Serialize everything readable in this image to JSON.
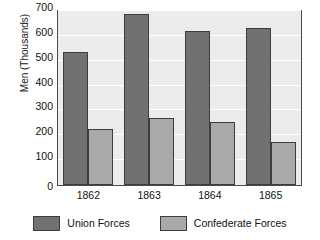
{
  "chart_data": {
    "type": "bar",
    "title": "",
    "xlabel": "",
    "ylabel": "Men (Thousands)",
    "categories": [
      "1862",
      "1863",
      "1864",
      "1865"
    ],
    "series": [
      {
        "name": "Union Forces",
        "color": "#717171",
        "values": [
          535,
          690,
          620,
          630
        ]
      },
      {
        "name": "Confederate Forces",
        "color": "#a9a9a9",
        "values": [
          225,
          270,
          255,
          175
        ]
      }
    ],
    "ylim": [
      0,
      700
    ],
    "yticks": [
      0,
      100,
      200,
      300,
      400,
      500,
      600,
      700
    ],
    "ytick_labels": [
      "0",
      "100",
      "200",
      "300",
      "400",
      "500",
      "600",
      "700"
    ],
    "grid": true,
    "grid_color": "#ffffff",
    "plot_background": "#ececec",
    "figure_background": "#ffffff",
    "legend_position": "bottom",
    "legend": [
      {
        "label": "Union Forces",
        "color": "#717171"
      },
      {
        "label": "Confederate Forces",
        "color": "#a9a9a9"
      }
    ]
  }
}
